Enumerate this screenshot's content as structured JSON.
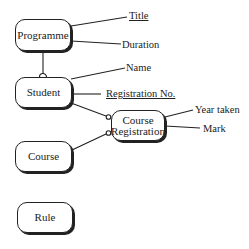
{
  "diagram": {
    "type": "entity-relationship",
    "entities": [
      {
        "id": "programme",
        "label": "Programme"
      },
      {
        "id": "student",
        "label": "Student"
      },
      {
        "id": "course_registration",
        "label_line1": "Course",
        "label_line2": "Registration"
      },
      {
        "id": "course",
        "label": "Course"
      },
      {
        "id": "rule",
        "label": "Rule"
      }
    ],
    "attributes": {
      "programme": [
        {
          "label": "Title",
          "key": true
        },
        {
          "label": "Duration",
          "key": false
        }
      ],
      "student": [
        {
          "label": "Name",
          "key": false
        },
        {
          "label": "Registration No.",
          "key": true
        }
      ],
      "course_registration": [
        {
          "label": "Year taken",
          "key": false
        },
        {
          "label": "Mark",
          "key": false
        }
      ]
    },
    "relationships": [
      {
        "from": "Programme",
        "to": "Student",
        "optional_end": "Student"
      },
      {
        "from": "Student",
        "to": "Course Registration",
        "optional_end": "Course Registration"
      },
      {
        "from": "Course",
        "to": "Course Registration",
        "optional_end": "Course Registration"
      }
    ]
  }
}
